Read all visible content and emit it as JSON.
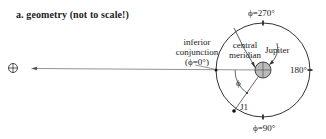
{
  "title": "a. geometry (not to scale!)",
  "labels": {
    "phi270": "ϕ=270°",
    "phi90": "ϕ=90°",
    "deg180": "180°",
    "inferior_line1": "inferior",
    "inferior_line2": "conjunction",
    "inferior_line3": "(ϕ=0°)",
    "central_line1": "central",
    "central_line2": "meridian",
    "jupiter": "Jupiter",
    "phi": "ϕ",
    "j1": "J1"
  },
  "icons": {
    "earth": "earth-symbol-icon"
  }
}
